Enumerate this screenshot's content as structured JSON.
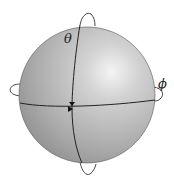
{
  "diagram": {
    "type": "sphere-rotation-angles",
    "labels": {
      "theta": "θ",
      "phi": "ϕ"
    },
    "colors": {
      "sphere_light": "#f2f2f2",
      "sphere_mid": "#b4b4b4",
      "sphere_dark": "#8a8a8a",
      "line": "#222222",
      "background": "#ffffff"
    }
  }
}
